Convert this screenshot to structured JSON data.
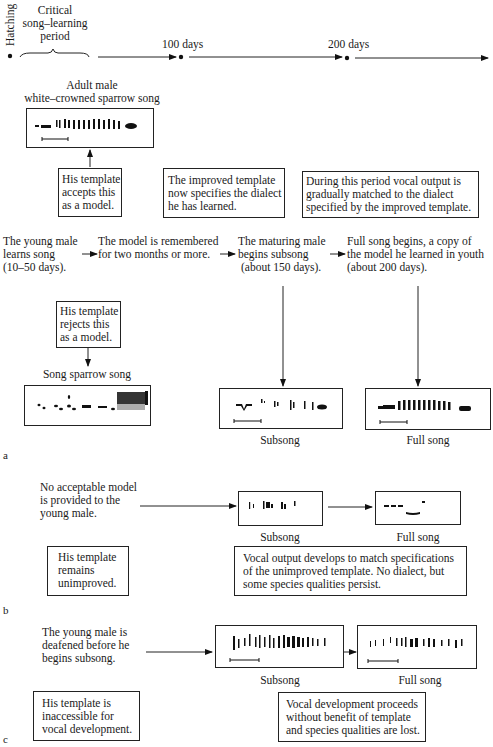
{
  "timeline": {
    "hatching": "Hatching",
    "critical_period": [
      "Critical",
      "song–learning",
      "period"
    ],
    "day100": "100 days",
    "day200": "200 days"
  },
  "panel_a": {
    "label": "a",
    "adult_song_title": [
      "Adult male",
      "white–crowned sparrow song"
    ],
    "accepts_box": [
      "His template",
      "accepts this",
      "as a model."
    ],
    "improved_box": [
      "The improved template",
      "now specifies the dialect",
      "he has learned."
    ],
    "during_box": [
      "During this period vocal output is",
      "gradually matched to the dialect",
      "specified by the improved template."
    ],
    "stages": [
      {
        "lines": [
          "The young male",
          "learns song",
          "(10–50 days)."
        ]
      },
      {
        "lines": [
          "The model is remembered",
          "for two months or more."
        ]
      },
      {
        "lines": [
          "The maturing male",
          "begins subsong",
          "(about 150 days)."
        ]
      },
      {
        "lines": [
          "Full song begins, a copy of",
          "the model he learned in youth",
          "(about 200 days)."
        ]
      }
    ],
    "rejects_box": [
      "His template",
      "rejects this",
      "as a model."
    ],
    "song_sparrow_title": "Song sparrow song",
    "subsong_caption": "Subsong",
    "fullsong_caption": "Full song"
  },
  "panel_b": {
    "label": "b",
    "intro": [
      "No acceptable model",
      "is provided to the",
      "young male."
    ],
    "subsong_caption": "Subsong",
    "fullsong_caption": "Full song",
    "template_box": [
      "His template",
      "remains",
      "unimproved."
    ],
    "vocal_box": [
      "Vocal output develops to match specifications",
      "of the unimproved template. No dialect, but",
      "some species qualities persist."
    ]
  },
  "panel_c": {
    "label": "c",
    "intro": [
      "The young male is",
      "deafened before he",
      "begins subsong."
    ],
    "subsong_caption": "Subsong",
    "fullsong_caption": "Full song",
    "template_box": [
      "His template is",
      "inaccessible for",
      "vocal development."
    ],
    "vocal_box": [
      "Vocal development proceeds",
      "without benefit of template",
      "and species qualities are lost."
    ]
  }
}
